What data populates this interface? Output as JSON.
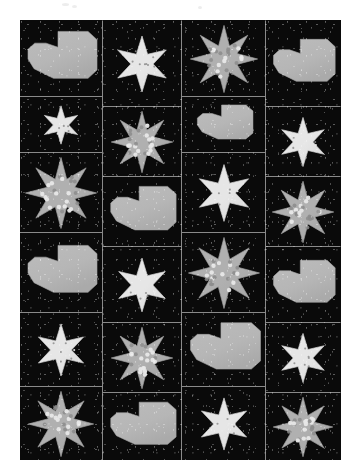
{
  "artwork": {
    "title": "Star and Heart Patchwork Quilt",
    "medium": "photograph of pieced quilt",
    "background_color": "#ffffff",
    "quilt_background_color": "#0a0a0a",
    "seam_color": "#8a8a8a",
    "palette": {
      "black_speckled_fabric": "#0a0a0a",
      "gray_polkadot_fabric": "#b0b0b0",
      "white_star_fabric": "#e6e6e6",
      "heart_fabric": "#b6b6b6",
      "dot_light": "#e8e8e8",
      "dot_dark": "#8c8c8c"
    },
    "bounds": {
      "x": 20,
      "y": 20,
      "width": 321,
      "height": 440
    },
    "grid": {
      "columns": 4,
      "rows_per_column": 6,
      "total_blocks": 24
    }
  },
  "columns": [
    {
      "name": "column-1",
      "x": 0,
      "width": 83,
      "blocks": [
        {
          "motif": "heart",
          "size": "large",
          "height": 76,
          "fabric": "#b6b6b6",
          "dots": false
        },
        {
          "motif": "star-6",
          "size": "small",
          "height": 56,
          "fabric": "#e6e6e6",
          "dots": true
        },
        {
          "motif": "star-8",
          "size": "large",
          "height": 80,
          "fabric": "#b0b0b0",
          "dots": true
        },
        {
          "motif": "heart",
          "size": "large",
          "height": 80,
          "fabric": "#b6b6b6",
          "dots": false
        },
        {
          "motif": "star-6",
          "size": "small",
          "height": 74,
          "fabric": "#e6e6e6",
          "dots": true
        },
        {
          "motif": "star-8",
          "size": "large",
          "height": 74,
          "fabric": "#b0b0b0",
          "dots": true
        }
      ]
    },
    {
      "name": "column-2",
      "x": 83,
      "width": 79,
      "blocks": [
        {
          "motif": "star-6",
          "size": "small",
          "height": 86,
          "fabric": "#e6e6e6",
          "dots": true
        },
        {
          "motif": "star-8",
          "size": "large",
          "height": 70,
          "fabric": "#b0b0b0",
          "dots": true
        },
        {
          "motif": "heart",
          "size": "large",
          "height": 70,
          "fabric": "#b6b6b6",
          "dots": false
        },
        {
          "motif": "star-6",
          "size": "small",
          "height": 76,
          "fabric": "#e6e6e6",
          "dots": true
        },
        {
          "motif": "star-8",
          "size": "large",
          "height": 70,
          "fabric": "#b0b0b0",
          "dots": true
        },
        {
          "motif": "heart",
          "size": "large",
          "height": 68,
          "fabric": "#b6b6b6",
          "dots": false
        }
      ]
    },
    {
      "name": "column-3",
      "x": 162,
      "width": 84,
      "blocks": [
        {
          "motif": "star-8",
          "size": "large",
          "height": 76,
          "fabric": "#b0b0b0",
          "dots": true
        },
        {
          "motif": "heart",
          "size": "large",
          "height": 56,
          "fabric": "#b6b6b6",
          "dots": false
        },
        {
          "motif": "star-6",
          "size": "small",
          "height": 80,
          "fabric": "#e6e6e6",
          "dots": true
        },
        {
          "motif": "star-8",
          "size": "large",
          "height": 80,
          "fabric": "#b0b0b0",
          "dots": true
        },
        {
          "motif": "heart",
          "size": "large",
          "height": 74,
          "fabric": "#b6b6b6",
          "dots": false
        },
        {
          "motif": "star-6",
          "size": "small",
          "height": 74,
          "fabric": "#e6e6e6",
          "dots": true
        }
      ]
    },
    {
      "name": "column-4",
      "x": 246,
      "width": 75,
      "blocks": [
        {
          "motif": "heart",
          "size": "large",
          "height": 86,
          "fabric": "#b6b6b6",
          "dots": false
        },
        {
          "motif": "star-6",
          "size": "small",
          "height": 70,
          "fabric": "#e6e6e6",
          "dots": true
        },
        {
          "motif": "star-8",
          "size": "large",
          "height": 70,
          "fabric": "#b0b0b0",
          "dots": true
        },
        {
          "motif": "heart",
          "size": "large",
          "height": 76,
          "fabric": "#b6b6b6",
          "dots": false
        },
        {
          "motif": "star-6",
          "size": "small",
          "height": 70,
          "fabric": "#e6e6e6",
          "dots": true
        },
        {
          "motif": "star-8",
          "size": "large",
          "height": 68,
          "fabric": "#b0b0b0",
          "dots": true
        }
      ]
    }
  ]
}
